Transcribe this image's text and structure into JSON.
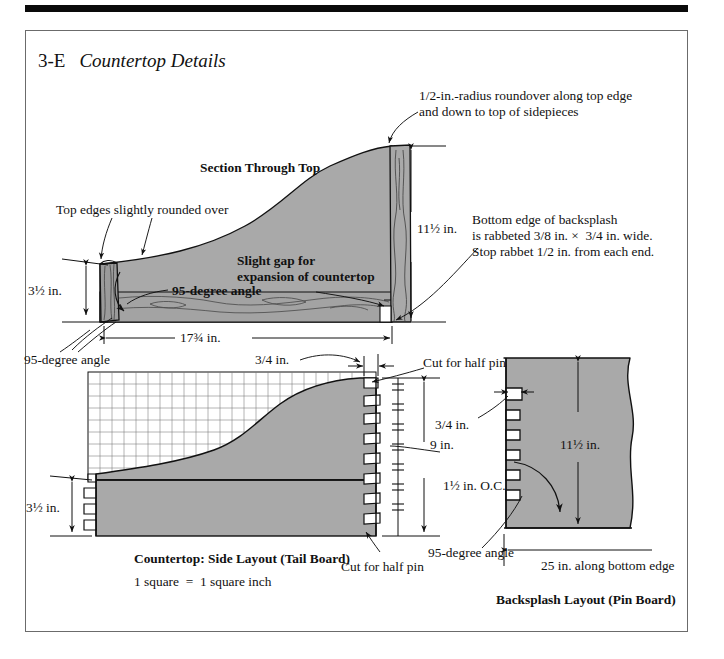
{
  "page": {
    "figure_number": "3-E",
    "title": "Countertop Details",
    "background": "#ffffff",
    "rule_color": "#0a0a0a",
    "frame_color": "#6b6b6b",
    "wood_fill": "#a9a9a9",
    "wood_fill_dark": "#9a9a9a",
    "line_color": "#111111"
  },
  "section_top": {
    "heading": "Section Through Top",
    "callouts": {
      "roundover": "1/2-in.-radius roundover along top edge\nand down to top of sidepieces",
      "top_edges": "Top edges slightly rounded over",
      "gap": "Slight gap for\nexpansion of countertop",
      "rabbet": "Bottom edge of backsplash\nis rabbeted 3/8 in. ×  3/4 in. wide.\nStop rabbet 1/2 in. from each end."
    },
    "dimensions": {
      "height_left": "3½ in.",
      "height_right": "11½ in.",
      "width": "17¾ in.",
      "angle": "95-degree angle"
    }
  },
  "side_layout": {
    "caption_bold": "Countertop: Side Layout (Tail Board)",
    "caption_note": "1 square  =  1 square inch",
    "grid": {
      "cols": 24,
      "rows": 9,
      "square_label": "1 square = 1 square inch"
    },
    "dimensions": {
      "angle": "95-degree angle",
      "pin_width": "3/4 in.",
      "height_left": "3½ in.",
      "height_right": "9 in.",
      "spacing": "1½ in. O.C."
    },
    "callouts": {
      "half_pin_top": "Cut for half pin",
      "half_pin_bottom": "Cut for half pin"
    }
  },
  "backsplash_layout": {
    "caption_bold": "Backsplash Layout (Pin Board)",
    "dimensions": {
      "pin_width": "3/4 in.",
      "height": "11½ in.",
      "bottom_edge": "25 in. along bottom edge",
      "angle": "95-degree angle"
    }
  }
}
